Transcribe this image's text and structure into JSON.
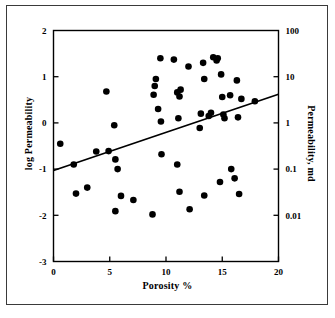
{
  "chart_data": {
    "type": "scatter",
    "title": "",
    "xlabel": "Porosity %",
    "ylabel": "log Permeability",
    "y2label": "Permeability, md",
    "xlim": [
      0,
      20
    ],
    "ylim": [
      -3,
      2
    ],
    "xticks": [
      0,
      5,
      10,
      15,
      20
    ],
    "xticklabels": [
      "0",
      "5",
      "10",
      "15",
      "20"
    ],
    "yticks": [
      2,
      1,
      0,
      -1,
      -2,
      -3
    ],
    "yticklabels": [
      "2",
      "1",
      "0",
      "-1",
      "-2",
      "-3"
    ],
    "y2ticks": [
      2,
      1,
      0,
      -1,
      -2
    ],
    "y2ticklabels": [
      "100",
      "10",
      "1",
      "0.1",
      "0.01"
    ],
    "grid": false,
    "legend": null,
    "marker_color": "#000000",
    "marker_size": 4.6,
    "line_color": "#000000",
    "series": [
      {
        "name": "core samples",
        "points": [
          [
            0.6,
            -0.45
          ],
          [
            1.8,
            -0.9
          ],
          [
            2.0,
            -1.53
          ],
          [
            3.0,
            -1.4
          ],
          [
            3.8,
            -0.62
          ],
          [
            4.7,
            0.68
          ],
          [
            4.9,
            -0.61
          ],
          [
            5.4,
            -0.05
          ],
          [
            5.5,
            -0.79
          ],
          [
            5.5,
            -1.91
          ],
          [
            5.7,
            -1.0
          ],
          [
            6.0,
            -1.58
          ],
          [
            7.1,
            -1.67
          ],
          [
            8.8,
            -1.98
          ],
          [
            8.9,
            0.61
          ],
          [
            9.0,
            0.8
          ],
          [
            9.1,
            0.95
          ],
          [
            9.3,
            0.3
          ],
          [
            9.5,
            1.4
          ],
          [
            9.55,
            0.03
          ],
          [
            9.6,
            -0.68
          ],
          [
            10.7,
            1.37
          ],
          [
            11.0,
            0.66
          ],
          [
            11.0,
            -0.9
          ],
          [
            11.1,
            0.1
          ],
          [
            11.2,
            0.57
          ],
          [
            11.2,
            -1.49
          ],
          [
            11.3,
            0.72
          ],
          [
            12.0,
            1.22
          ],
          [
            12.1,
            -1.87
          ],
          [
            13.0,
            -0.11
          ],
          [
            13.1,
            0.2
          ],
          [
            13.3,
            1.3
          ],
          [
            13.4,
            0.95
          ],
          [
            13.4,
            -1.57
          ],
          [
            13.8,
            0.15
          ],
          [
            14.0,
            0.22
          ],
          [
            14.2,
            1.42
          ],
          [
            14.5,
            1.35
          ],
          [
            14.6,
            1.4
          ],
          [
            14.8,
            -1.28
          ],
          [
            14.9,
            1.05
          ],
          [
            15.0,
            0.56
          ],
          [
            15.1,
            0.18
          ],
          [
            15.2,
            0.1
          ],
          [
            15.7,
            0.6
          ],
          [
            15.8,
            -1.0
          ],
          [
            16.1,
            -1.2
          ],
          [
            16.3,
            0.92
          ],
          [
            16.4,
            0.12
          ],
          [
            16.5,
            -1.54
          ],
          [
            16.7,
            0.52
          ],
          [
            17.9,
            0.47
          ]
        ]
      }
    ],
    "trendline": {
      "name": "regression line",
      "x_start": 0,
      "y_start": -1.03,
      "x_end": 20,
      "y_end": 0.62
    }
  }
}
